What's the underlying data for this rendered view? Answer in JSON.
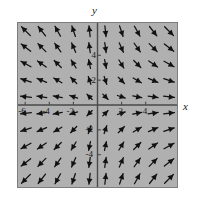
{
  "figure": {
    "type": "vector-field-plot",
    "axis_labels": {
      "x": "x",
      "y": "y"
    },
    "plot_bg_color": "#b0b0b0",
    "frame_color": "#7d7d7d",
    "axis_color": "#4a4a4a",
    "arrow_color": "#111111",
    "x_tick_labels": [
      "-6",
      "-4",
      "-2",
      "2",
      "4"
    ],
    "y_tick_labels": [
      "4",
      "2",
      "-2",
      "-4"
    ]
  },
  "chart_data": {
    "type": "scatter",
    "title": "",
    "xlabel": "x",
    "ylabel": "y",
    "xlim": [
      -6.6,
      6.6
    ],
    "ylim": [
      -6.6,
      6.6
    ],
    "grid": false,
    "legend": "none",
    "xticks": [
      -6,
      -4,
      -2,
      2,
      4
    ],
    "yticks": [
      4,
      2,
      -2,
      -4
    ],
    "field": {
      "description": "Slope/vector field on a 10x10 grid. Arrows point down-right in quadrant I, up-left in quadrant II, down-left in quadrant III, up-right in quadrant IV; near the x-axis arrows become nearly horizontal pointing away from the y-axis.",
      "u_formula": "x",
      "v_formula": "-y",
      "grid_nx": 10,
      "grid_ny": 10,
      "x_samples": [
        -5.94,
        -4.62,
        -3.3,
        -1.98,
        -0.66,
        0.66,
        1.98,
        3.3,
        4.62,
        5.94
      ],
      "y_samples": [
        5.94,
        4.62,
        3.3,
        1.98,
        0.66,
        -0.66,
        -1.98,
        -3.3,
        -4.62,
        -5.94
      ],
      "arrows": [
        {
          "x": -5.94,
          "y": 5.94,
          "u": -5.94,
          "v": 5.94
        },
        {
          "x": -4.62,
          "y": 5.94,
          "u": -4.62,
          "v": 5.94
        },
        {
          "x": -3.3,
          "y": 5.94,
          "u": -3.3,
          "v": 5.94
        },
        {
          "x": -1.98,
          "y": 5.94,
          "u": -1.98,
          "v": 5.94
        },
        {
          "x": -0.66,
          "y": 5.94,
          "u": -0.66,
          "v": 5.94
        },
        {
          "x": 0.66,
          "y": 5.94,
          "u": 0.66,
          "v": -5.94
        },
        {
          "x": 1.98,
          "y": 5.94,
          "u": 1.98,
          "v": -5.94
        },
        {
          "x": 3.3,
          "y": 5.94,
          "u": 3.3,
          "v": -5.94
        },
        {
          "x": 4.62,
          "y": 5.94,
          "u": 4.62,
          "v": -5.94
        },
        {
          "x": 5.94,
          "y": 5.94,
          "u": 5.94,
          "v": -5.94
        },
        {
          "x": -5.94,
          "y": 4.62,
          "u": -5.94,
          "v": 4.62
        },
        {
          "x": -4.62,
          "y": 4.62,
          "u": -4.62,
          "v": 4.62
        },
        {
          "x": -3.3,
          "y": 4.62,
          "u": -3.3,
          "v": 4.62
        },
        {
          "x": -1.98,
          "y": 4.62,
          "u": -1.98,
          "v": 4.62
        },
        {
          "x": -0.66,
          "y": 4.62,
          "u": -0.66,
          "v": 4.62
        },
        {
          "x": 0.66,
          "y": 4.62,
          "u": 0.66,
          "v": -4.62
        },
        {
          "x": 1.98,
          "y": 4.62,
          "u": 1.98,
          "v": -4.62
        },
        {
          "x": 3.3,
          "y": 4.62,
          "u": 3.3,
          "v": -4.62
        },
        {
          "x": 4.62,
          "y": 4.62,
          "u": 4.62,
          "v": -4.62
        },
        {
          "x": 5.94,
          "y": 4.62,
          "u": 5.94,
          "v": -4.62
        },
        {
          "x": -5.94,
          "y": 3.3,
          "u": -5.94,
          "v": 3.3
        },
        {
          "x": -4.62,
          "y": 3.3,
          "u": -4.62,
          "v": 3.3
        },
        {
          "x": -3.3,
          "y": 3.3,
          "u": -3.3,
          "v": 3.3
        },
        {
          "x": -1.98,
          "y": 3.3,
          "u": -1.98,
          "v": 3.3
        },
        {
          "x": -0.66,
          "y": 3.3,
          "u": -0.66,
          "v": 3.3
        },
        {
          "x": 0.66,
          "y": 3.3,
          "u": 0.66,
          "v": -3.3
        },
        {
          "x": 1.98,
          "y": 3.3,
          "u": 1.98,
          "v": -3.3
        },
        {
          "x": 3.3,
          "y": 3.3,
          "u": 3.3,
          "v": -3.3
        },
        {
          "x": 4.62,
          "y": 3.3,
          "u": 4.62,
          "v": -3.3
        },
        {
          "x": 5.94,
          "y": 3.3,
          "u": 5.94,
          "v": -3.3
        },
        {
          "x": -5.94,
          "y": 1.98,
          "u": -5.94,
          "v": 1.98
        },
        {
          "x": -4.62,
          "y": 1.98,
          "u": -4.62,
          "v": 1.98
        },
        {
          "x": -3.3,
          "y": 1.98,
          "u": -3.3,
          "v": 1.98
        },
        {
          "x": -1.98,
          "y": 1.98,
          "u": -1.98,
          "v": 1.98
        },
        {
          "x": -0.66,
          "y": 1.98,
          "u": -0.66,
          "v": 1.98
        },
        {
          "x": 0.66,
          "y": 1.98,
          "u": 0.66,
          "v": -1.98
        },
        {
          "x": 1.98,
          "y": 1.98,
          "u": 1.98,
          "v": -1.98
        },
        {
          "x": 3.3,
          "y": 1.98,
          "u": 3.3,
          "v": -1.98
        },
        {
          "x": 4.62,
          "y": 1.98,
          "u": 4.62,
          "v": -1.98
        },
        {
          "x": 5.94,
          "y": 1.98,
          "u": 5.94,
          "v": -1.98
        },
        {
          "x": -5.94,
          "y": 0.66,
          "u": -5.94,
          "v": 0.66
        },
        {
          "x": -4.62,
          "y": 0.66,
          "u": -4.62,
          "v": 0.66
        },
        {
          "x": -3.3,
          "y": 0.66,
          "u": -3.3,
          "v": 0.66
        },
        {
          "x": -1.98,
          "y": 0.66,
          "u": -1.98,
          "v": 0.66
        },
        {
          "x": -0.66,
          "y": 0.66,
          "u": -0.66,
          "v": 0.66
        },
        {
          "x": 0.66,
          "y": 0.66,
          "u": 0.66,
          "v": -0.66
        },
        {
          "x": 1.98,
          "y": 0.66,
          "u": 1.98,
          "v": -0.66
        },
        {
          "x": 3.3,
          "y": 0.66,
          "u": 3.3,
          "v": -0.66
        },
        {
          "x": 4.62,
          "y": 0.66,
          "u": 4.62,
          "v": -0.66
        },
        {
          "x": 5.94,
          "y": 0.66,
          "u": 5.94,
          "v": -0.66
        },
        {
          "x": -5.94,
          "y": -0.66,
          "u": -5.94,
          "v": -0.66
        },
        {
          "x": -4.62,
          "y": -0.66,
          "u": -4.62,
          "v": -0.66
        },
        {
          "x": -3.3,
          "y": -0.66,
          "u": -3.3,
          "v": -0.66
        },
        {
          "x": -1.98,
          "y": -0.66,
          "u": -1.98,
          "v": -0.66
        },
        {
          "x": -0.66,
          "y": -0.66,
          "u": -0.66,
          "v": -0.66
        },
        {
          "x": 0.66,
          "y": -0.66,
          "u": 0.66,
          "v": 0.66
        },
        {
          "x": 1.98,
          "y": -0.66,
          "u": 1.98,
          "v": 0.66
        },
        {
          "x": 3.3,
          "y": -0.66,
          "u": 3.3,
          "v": 0.66
        },
        {
          "x": 4.62,
          "y": -0.66,
          "u": 4.62,
          "v": 0.66
        },
        {
          "x": 5.94,
          "y": -0.66,
          "u": 5.94,
          "v": 0.66
        },
        {
          "x": -5.94,
          "y": -1.98,
          "u": -5.94,
          "v": -1.98
        },
        {
          "x": -4.62,
          "y": -1.98,
          "u": -4.62,
          "v": -1.98
        },
        {
          "x": -3.3,
          "y": -1.98,
          "u": -3.3,
          "v": -1.98
        },
        {
          "x": -1.98,
          "y": -1.98,
          "u": -1.98,
          "v": -1.98
        },
        {
          "x": -0.66,
          "y": -1.98,
          "u": -0.66,
          "v": -1.98
        },
        {
          "x": 0.66,
          "y": -1.98,
          "u": 0.66,
          "v": 1.98
        },
        {
          "x": 1.98,
          "y": -1.98,
          "u": 1.98,
          "v": 1.98
        },
        {
          "x": 3.3,
          "y": -1.98,
          "u": 3.3,
          "v": 1.98
        },
        {
          "x": 4.62,
          "y": -1.98,
          "u": 4.62,
          "v": 1.98
        },
        {
          "x": 5.94,
          "y": -1.98,
          "u": 5.94,
          "v": 1.98
        },
        {
          "x": -5.94,
          "y": -3.3,
          "u": -5.94,
          "v": -3.3
        },
        {
          "x": -4.62,
          "y": -3.3,
          "u": -4.62,
          "v": -3.3
        },
        {
          "x": -3.3,
          "y": -3.3,
          "u": -3.3,
          "v": -3.3
        },
        {
          "x": -1.98,
          "y": -3.3,
          "u": -1.98,
          "v": -3.3
        },
        {
          "x": -0.66,
          "y": -3.3,
          "u": -0.66,
          "v": -3.3
        },
        {
          "x": 0.66,
          "y": -3.3,
          "u": 0.66,
          "v": 3.3
        },
        {
          "x": 1.98,
          "y": -3.3,
          "u": 1.98,
          "v": 3.3
        },
        {
          "x": 3.3,
          "y": -3.3,
          "u": 3.3,
          "v": 3.3
        },
        {
          "x": 4.62,
          "y": -3.3,
          "u": 4.62,
          "v": 3.3
        },
        {
          "x": 5.94,
          "y": -3.3,
          "u": 5.94,
          "v": 3.3
        },
        {
          "x": -5.94,
          "y": -4.62,
          "u": -5.94,
          "v": -4.62
        },
        {
          "x": -4.62,
          "y": -4.62,
          "u": -4.62,
          "v": -4.62
        },
        {
          "x": -3.3,
          "y": -4.62,
          "u": -3.3,
          "v": -4.62
        },
        {
          "x": -1.98,
          "y": -4.62,
          "u": -1.98,
          "v": -4.62
        },
        {
          "x": -0.66,
          "y": -4.62,
          "u": -0.66,
          "v": -4.62
        },
        {
          "x": 0.66,
          "y": -4.62,
          "u": 0.66,
          "v": 4.62
        },
        {
          "x": 1.98,
          "y": -4.62,
          "u": 1.98,
          "v": 4.62
        },
        {
          "x": 3.3,
          "y": -4.62,
          "u": 3.3,
          "v": 4.62
        },
        {
          "x": 4.62,
          "y": -4.62,
          "u": 4.62,
          "v": 4.62
        },
        {
          "x": 5.94,
          "y": -4.62,
          "u": 5.94,
          "v": 4.62
        },
        {
          "x": -5.94,
          "y": -5.94,
          "u": -5.94,
          "v": -5.94
        },
        {
          "x": -4.62,
          "y": -5.94,
          "u": -4.62,
          "v": -5.94
        },
        {
          "x": -3.3,
          "y": -5.94,
          "u": -3.3,
          "v": -5.94
        },
        {
          "x": -1.98,
          "y": -5.94,
          "u": -1.98,
          "v": -5.94
        },
        {
          "x": -0.66,
          "y": -5.94,
          "u": -0.66,
          "v": -5.94
        },
        {
          "x": 0.66,
          "y": -5.94,
          "u": 0.66,
          "v": 5.94
        },
        {
          "x": 1.98,
          "y": -5.94,
          "u": 1.98,
          "v": 5.94
        },
        {
          "x": 3.3,
          "y": -5.94,
          "u": 3.3,
          "v": 5.94
        },
        {
          "x": 4.62,
          "y": -5.94,
          "u": 4.62,
          "v": 5.94
        },
        {
          "x": 5.94,
          "y": -5.94,
          "u": 5.94,
          "v": 5.94
        }
      ]
    }
  }
}
